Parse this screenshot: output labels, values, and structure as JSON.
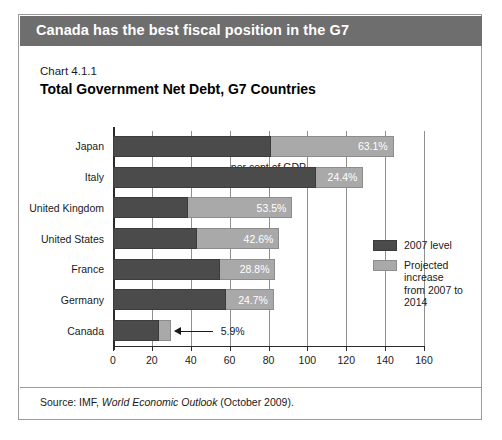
{
  "banner": {
    "title": "Canada has the best fiscal position in the G7"
  },
  "chart_header": {
    "number": "Chart 4.1.1",
    "title": "Total Government Net Debt, G7 Countries"
  },
  "source": {
    "prefix": "Source: IMF, ",
    "italic": "World Economic Outlook",
    "suffix": " (October 2009)."
  },
  "legend": {
    "position": "inside-right",
    "items": [
      {
        "label": "2007 level",
        "color": "#4b4b4b"
      },
      {
        "label": "Projected increase\nfrom 2007 to 2014",
        "color": "#a9a9a9"
      }
    ],
    "item0_label": "2007 level",
    "item1_line1": "Projected increase",
    "item1_line2": "from 2007 to 2014"
  },
  "colors": {
    "banner_bg": "#6e6e6e",
    "dark_series": "#4b4b4b",
    "light_series": "#a9a9a9",
    "frame": "#9a9a9a",
    "grid": "#8f8f8f"
  },
  "chart_data": {
    "type": "bar",
    "orientation": "horizontal",
    "stacked": true,
    "title": "Total Government Net Debt, G7 Countries",
    "subtitle": "Chart 4.1.1",
    "xlabel": "per cent of GDP",
    "ylabel": "",
    "xlim": [
      0,
      160
    ],
    "xticks": [
      0,
      20,
      40,
      60,
      80,
      100,
      120,
      140,
      160
    ],
    "xtick_labels": [
      "0",
      "20",
      "40",
      "60",
      "80",
      "100",
      "120",
      "140",
      "160"
    ],
    "grid": true,
    "grid_axis": "x",
    "categories": [
      "Japan",
      "Italy",
      "United Kingdom",
      "United States",
      "France",
      "Germany",
      "Canada"
    ],
    "series": [
      {
        "name": "2007 level",
        "color": "#4b4b4b",
        "values": [
          81.3,
          104.4,
          38.8,
          43.0,
          54.8,
          58.1,
          23.8
        ]
      },
      {
        "name": "Projected increase from 2007 to 2014",
        "color": "#a9a9a9",
        "values": [
          63.1,
          24.4,
          53.5,
          42.6,
          28.8,
          24.7,
          5.9
        ]
      }
    ],
    "data_labels": [
      "63.1%",
      "24.4%",
      "53.5%",
      "42.6%",
      "28.8%",
      "24.7%",
      "5.9%"
    ],
    "data_label_series": "Projected increase from 2007 to 2014",
    "totals": [
      144.4,
      128.8,
      92.3,
      85.6,
      83.6,
      82.8,
      29.7
    ],
    "annotation": {
      "category": "Canada",
      "text": "5.9%",
      "style": "arrow pointing left to bar segment"
    }
  },
  "rows": [
    {
      "category": "Japan",
      "dark": 81.3,
      "light": 63.1,
      "label": "63.1%",
      "label_outside": false
    },
    {
      "category": "Italy",
      "dark": 104.4,
      "light": 24.4,
      "label": "24.4%",
      "label_outside": false
    },
    {
      "category": "United Kingdom",
      "dark": 38.8,
      "light": 53.5,
      "label": "53.5%",
      "label_outside": false
    },
    {
      "category": "United States",
      "dark": 43.0,
      "light": 42.6,
      "label": "42.6%",
      "label_outside": false
    },
    {
      "category": "France",
      "dark": 54.8,
      "light": 28.8,
      "label": "28.8%",
      "label_outside": false
    },
    {
      "category": "Germany",
      "dark": 58.1,
      "light": 24.7,
      "label": "24.7%",
      "label_outside": false
    },
    {
      "category": "Canada",
      "dark": 23.8,
      "light": 5.9,
      "label": "5.9%",
      "label_outside": true
    }
  ]
}
